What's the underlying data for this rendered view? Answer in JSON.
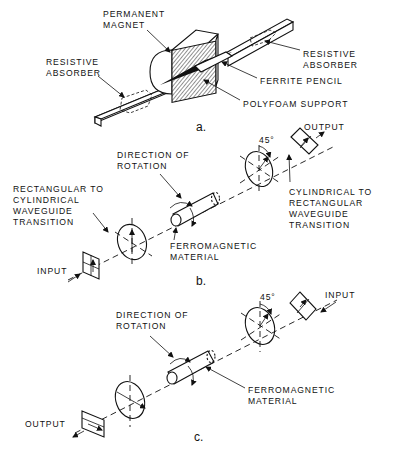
{
  "figure": {
    "panel_a": {
      "caption": "a.",
      "labels": {
        "permanent_magnet": [
          "PERMANENT",
          "MAGNET"
        ],
        "resistive_absorber_left": [
          "RESISTIVE",
          "ABSORBER"
        ],
        "resistive_absorber_right": [
          "RESISTIVE",
          "ABSORBER"
        ],
        "ferrite_pencil": "FERRITE PENCIL",
        "polyfoam_support": "POLYFOAM SUPPORT"
      }
    },
    "panel_b": {
      "caption": "b.",
      "labels": {
        "output": "OUTPUT",
        "angle": "45°",
        "direction_of_rotation": [
          "DIRECTION OF",
          "ROTATION"
        ],
        "rect_to_cyl": [
          "RECTANGULAR TO",
          "CYLINDRICAL",
          "WAVEGUIDE",
          "TRANSITION"
        ],
        "cyl_to_rect": [
          "CYLINDRICAL TO",
          "RECTANGULAR",
          "WAVEGUIDE",
          "TRANSITION"
        ],
        "ferromagnetic_material": [
          "FERROMAGNETIC",
          "MATERIAL"
        ],
        "input": "INPUT"
      }
    },
    "panel_c": {
      "caption": "c.",
      "labels": {
        "input": "INPUT",
        "angle": "45°",
        "direction_of_rotation": [
          "DIRECTION OF",
          "ROTATION"
        ],
        "ferromagnetic_material": [
          "FERROMAGNETIC",
          "MATERIAL"
        ],
        "output": "OUTPUT"
      }
    }
  }
}
